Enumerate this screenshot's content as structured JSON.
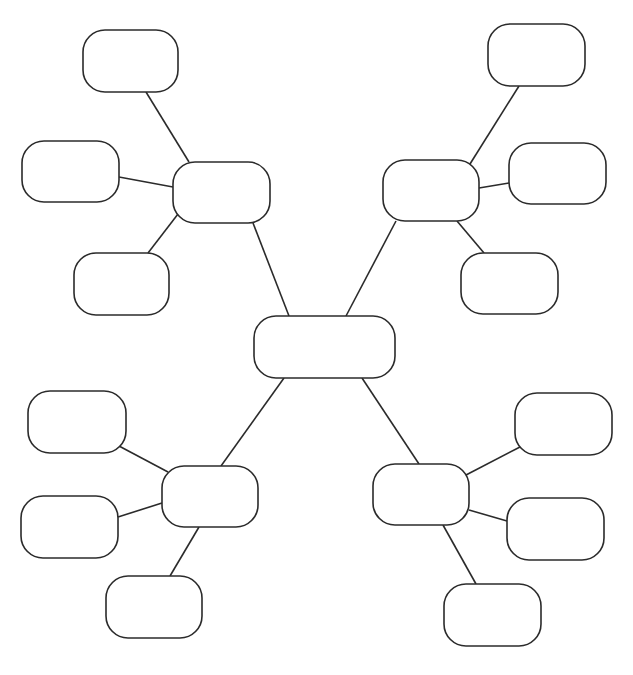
{
  "diagram": {
    "type": "mind-map",
    "canvas": {
      "width": 633,
      "height": 675,
      "background": "#ffffff"
    },
    "style": {
      "stroke": "#2b2b2b",
      "fill": "#ffffff",
      "corner_radius": 22
    },
    "nodes": [
      {
        "id": "center",
        "role": "central-topic",
        "x": 254,
        "y": 316,
        "w": 141,
        "h": 62,
        "label": ""
      },
      {
        "id": "tl",
        "role": "branch",
        "x": 173,
        "y": 162,
        "w": 97,
        "h": 61,
        "label": ""
      },
      {
        "id": "tl1",
        "role": "leaf",
        "x": 83,
        "y": 30,
        "w": 95,
        "h": 62,
        "label": ""
      },
      {
        "id": "tl2",
        "role": "leaf",
        "x": 22,
        "y": 141,
        "w": 97,
        "h": 61,
        "label": ""
      },
      {
        "id": "tl3",
        "role": "leaf",
        "x": 74,
        "y": 253,
        "w": 95,
        "h": 62,
        "label": ""
      },
      {
        "id": "tr",
        "role": "branch",
        "x": 383,
        "y": 160,
        "w": 96,
        "h": 61,
        "label": ""
      },
      {
        "id": "tr1",
        "role": "leaf",
        "x": 488,
        "y": 24,
        "w": 97,
        "h": 62,
        "label": ""
      },
      {
        "id": "tr2",
        "role": "leaf",
        "x": 509,
        "y": 143,
        "w": 97,
        "h": 61,
        "label": ""
      },
      {
        "id": "tr3",
        "role": "leaf",
        "x": 461,
        "y": 253,
        "w": 97,
        "h": 61,
        "label": ""
      },
      {
        "id": "bl",
        "role": "branch",
        "x": 162,
        "y": 466,
        "w": 96,
        "h": 61,
        "label": ""
      },
      {
        "id": "bl1",
        "role": "leaf",
        "x": 28,
        "y": 391,
        "w": 98,
        "h": 62,
        "label": ""
      },
      {
        "id": "bl2",
        "role": "leaf",
        "x": 21,
        "y": 496,
        "w": 97,
        "h": 62,
        "label": ""
      },
      {
        "id": "bl3",
        "role": "leaf",
        "x": 106,
        "y": 576,
        "w": 96,
        "h": 62,
        "label": ""
      },
      {
        "id": "br",
        "role": "branch",
        "x": 373,
        "y": 464,
        "w": 96,
        "h": 61,
        "label": ""
      },
      {
        "id": "br1",
        "role": "leaf",
        "x": 515,
        "y": 393,
        "w": 97,
        "h": 62,
        "label": ""
      },
      {
        "id": "br2",
        "role": "leaf",
        "x": 507,
        "y": 498,
        "w": 97,
        "h": 62,
        "label": ""
      },
      {
        "id": "br3",
        "role": "leaf",
        "x": 444,
        "y": 584,
        "w": 97,
        "h": 62,
        "label": ""
      }
    ],
    "edges": [
      {
        "from": "center",
        "to": "tl",
        "x1": 289,
        "y1": 316,
        "x2": 253,
        "y2": 223
      },
      {
        "from": "center",
        "to": "tr",
        "x1": 346,
        "y1": 316,
        "x2": 396,
        "y2": 221
      },
      {
        "from": "center",
        "to": "bl",
        "x1": 284,
        "y1": 378,
        "x2": 221,
        "y2": 466
      },
      {
        "from": "center",
        "to": "br",
        "x1": 362,
        "y1": 378,
        "x2": 419,
        "y2": 464
      },
      {
        "from": "tl",
        "to": "tl1",
        "x1": 189,
        "y1": 162,
        "x2": 146,
        "y2": 92
      },
      {
        "from": "tl",
        "to": "tl2",
        "x1": 173,
        "y1": 187,
        "x2": 119,
        "y2": 177
      },
      {
        "from": "tl",
        "to": "tl3",
        "x1": 178,
        "y1": 214,
        "x2": 148,
        "y2": 253
      },
      {
        "from": "tr",
        "to": "tr1",
        "x1": 470,
        "y1": 164,
        "x2": 519,
        "y2": 86
      },
      {
        "from": "tr",
        "to": "tr2",
        "x1": 479,
        "y1": 188,
        "x2": 509,
        "y2": 183
      },
      {
        "from": "tr",
        "to": "tr3",
        "x1": 457,
        "y1": 221,
        "x2": 484,
        "y2": 253
      },
      {
        "from": "bl",
        "to": "bl1",
        "x1": 168,
        "y1": 472,
        "x2": 119,
        "y2": 446
      },
      {
        "from": "bl",
        "to": "bl2",
        "x1": 162,
        "y1": 503,
        "x2": 118,
        "y2": 517
      },
      {
        "from": "bl",
        "to": "bl3",
        "x1": 199,
        "y1": 527,
        "x2": 170,
        "y2": 576
      },
      {
        "from": "br",
        "to": "br1",
        "x1": 466,
        "y1": 475,
        "x2": 520,
        "y2": 447
      },
      {
        "from": "br",
        "to": "br2",
        "x1": 469,
        "y1": 510,
        "x2": 507,
        "y2": 521
      },
      {
        "from": "br",
        "to": "br3",
        "x1": 443,
        "y1": 525,
        "x2": 476,
        "y2": 584
      }
    ]
  }
}
